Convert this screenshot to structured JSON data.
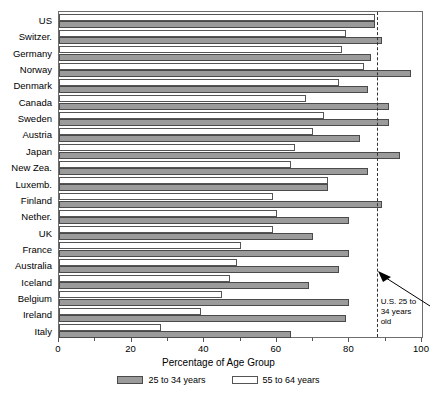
{
  "chart_data": {
    "type": "bar",
    "orientation": "horizontal",
    "title": "",
    "xlabel": "Percentage of Age Group",
    "ylabel": "",
    "xlim": [
      0,
      100
    ],
    "xticks": [
      0,
      20,
      40,
      60,
      80,
      100
    ],
    "xtick_labels": [
      "0",
      "20",
      "40",
      "60",
      "80",
      "100"
    ],
    "grid": false,
    "legend_position": "bottom",
    "categories": [
      "US",
      "Switzer.",
      "Germany",
      "Norway",
      "Denmark",
      "Canada",
      "Sweden",
      "Austria",
      "Japan",
      "New Zea.",
      "Luxemb.",
      "Finland",
      "Nether.",
      "UK",
      "France",
      "Australia",
      "Iceland",
      "Belgium",
      "Ireland",
      "Italy"
    ],
    "series": [
      {
        "name": "25 to 34 years",
        "color": "#9b9b9b",
        "values": [
          87,
          89,
          86,
          97,
          85,
          91,
          91,
          83,
          94,
          85,
          74,
          89,
          80,
          70,
          80,
          77,
          69,
          80,
          79,
          64
        ]
      },
      {
        "name": "55 to 64 years",
        "color": "#ffffff",
        "values": [
          87,
          79,
          78,
          84,
          77,
          68,
          73,
          70,
          65,
          64,
          74,
          59,
          60,
          59,
          50,
          49,
          47,
          45,
          39,
          28
        ]
      }
    ],
    "annotations": [
      {
        "type": "reference-line",
        "value": 87.5,
        "style": "dashed",
        "label": "U.S. 25 to\n34 years old"
      }
    ]
  },
  "legend": {
    "items": [
      {
        "label": "25 to 34 years",
        "swatch": "dark"
      },
      {
        "label": "55 to 64 years",
        "swatch": "light"
      }
    ]
  },
  "annotation": {
    "text": "U.S. 25 to\n34 years old"
  }
}
